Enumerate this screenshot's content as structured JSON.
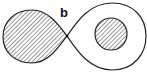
{
  "diagram": {
    "type": "figure-eight curve with hatched regions",
    "labels": {
      "crossing_point": "b"
    },
    "regions": [
      {
        "name": "left-lobe",
        "fill": "hatched"
      },
      {
        "name": "right-lobe",
        "fill": "none"
      },
      {
        "name": "inner-circle",
        "fill": "hatched"
      }
    ],
    "colors": {
      "stroke": "#222222",
      "hatch": "#333333",
      "background": "#ffffff"
    }
  }
}
